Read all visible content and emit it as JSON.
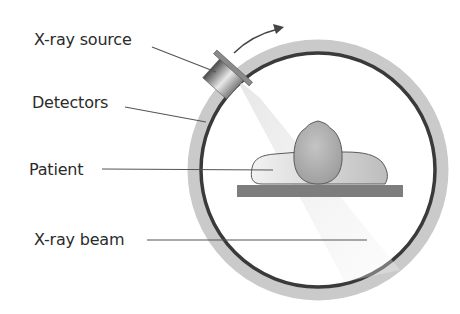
{
  "diagram": {
    "type": "CT scanner schematic",
    "labels": {
      "xray_source": "X-ray source",
      "detectors": "Detectors",
      "patient": "Patient",
      "xray_beam": "X-ray beam"
    },
    "colors": {
      "outer_ring": "#c9c9c9",
      "detector_ring": "#3a3a3a",
      "table": "#7d7d7d",
      "patient_fill": "#d6d6d6",
      "head_fill": "#a9a9a9",
      "leader_line": "#555555",
      "text": "#2b2b2b",
      "beam": "#e6e6e6"
    },
    "rotation_arrow": "clockwise-arrow"
  }
}
